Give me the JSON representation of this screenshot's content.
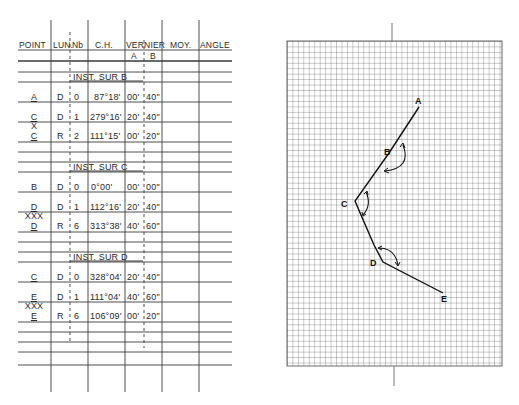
{
  "table": {
    "headers": [
      "POINT",
      "LUN.",
      "Nb",
      "C.H.",
      "VERNIER",
      "MOY.",
      "ANGLE"
    ],
    "vernier_sub": [
      "A",
      "B"
    ],
    "sections": [
      {
        "title": "INST. SUR B",
        "rows": [
          {
            "point": "A",
            "lun": "D",
            "nb": "0",
            "ch": "87°18'",
            "va": "00'",
            "vb": "40\""
          },
          {
            "point": "C",
            "lun": "D",
            "nb": "1",
            "ch": "279°16'",
            "va": "20'",
            "vb": "40\""
          },
          {
            "point": "C",
            "lun": "R",
            "nb": "2",
            "ch": "111°15'",
            "va": "00'",
            "vb": "20\""
          }
        ],
        "mark": "X"
      },
      {
        "title": "INST. SUR C",
        "rows": [
          {
            "point": "B",
            "lun": "D",
            "nb": "0",
            "ch": "0°00'",
            "va": "00'",
            "vb": "00\""
          },
          {
            "point": "D",
            "lun": "D",
            "nb": "1",
            "ch": "112°16'",
            "va": "20'",
            "vb": "40\""
          },
          {
            "point": "D",
            "lun": "R",
            "nb": "6",
            "ch": "313°38'",
            "va": "40'",
            "vb": "60\""
          }
        ],
        "mark": "XXX"
      },
      {
        "title": "INST. SUR D",
        "rows": [
          {
            "point": "C",
            "lun": "D",
            "nb": "0",
            "ch": "328°04'",
            "va": "20'",
            "vb": "40\""
          },
          {
            "point": "E",
            "lun": "D",
            "nb": "1",
            "ch": "111°04'",
            "va": "40'",
            "vb": "60\""
          },
          {
            "point": "E",
            "lun": "R",
            "nb": "6",
            "ch": "106°09'",
            "va": "00'",
            "vb": "20\""
          }
        ],
        "mark": "XXX"
      }
    ]
  },
  "diagram": {
    "points": [
      {
        "label": "A",
        "x": 419,
        "y": 107
      },
      {
        "label": "B",
        "x": 389,
        "y": 153
      },
      {
        "label": "C",
        "x": 355,
        "y": 201
      },
      {
        "label": "D",
        "x": 383,
        "y": 262
      },
      {
        "label": "E",
        "x": 443,
        "y": 293
      }
    ]
  },
  "colors": {
    "ink": "#2a2a2a",
    "grid": "#555555",
    "paper": "#ffffff"
  }
}
